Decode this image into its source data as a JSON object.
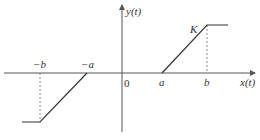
{
  "diagram": {
    "type": "piecewise-linear-function",
    "y_axis_label": "y(t)",
    "x_axis_label": "x(t)",
    "origin_label": "0",
    "ticks": {
      "neg_b": "−b",
      "neg_a": "−a",
      "pos_a": "a",
      "pos_b": "b"
    },
    "level_label": "K",
    "colors": {
      "line": "#333333",
      "axis": "#555555",
      "dashed": "#888888",
      "background": "#ffffff"
    },
    "segments": [
      {
        "name": "lower-plateau",
        "from": [
          "-inf",
          "-K"
        ],
        "to": [
          "-b",
          "-K"
        ]
      },
      {
        "name": "lower-ramp",
        "from": [
          "-b",
          "-K"
        ],
        "to": [
          "-a",
          "0"
        ]
      },
      {
        "name": "dead-zone",
        "from": [
          "-a",
          "0"
        ],
        "to": [
          "a",
          "0"
        ]
      },
      {
        "name": "upper-ramp",
        "from": [
          "a",
          "0"
        ],
        "to": [
          "b",
          "K"
        ]
      },
      {
        "name": "upper-plateau",
        "from": [
          "b",
          "K"
        ],
        "to": [
          "inf",
          "K"
        ]
      }
    ]
  }
}
